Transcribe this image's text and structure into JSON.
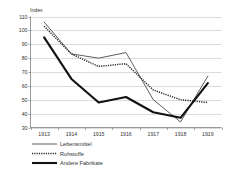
{
  "chart_data": {
    "type": "line",
    "title": "",
    "ylabel": "Index",
    "xlabel": "",
    "grid": true,
    "legend_position": "bottom-left",
    "ylim": [
      30,
      110
    ],
    "yticks": [
      30,
      40,
      50,
      60,
      70,
      80,
      90,
      100,
      110
    ],
    "categories": [
      "1913",
      "1914",
      "1915",
      "1916",
      "1917",
      "1918",
      "1919"
    ],
    "series": [
      {
        "name": "Lebensmittel",
        "style": "solid-thin",
        "color": "#4c4c4c",
        "values": [
          106,
          83,
          80,
          84,
          50,
          34,
          67
        ]
      },
      {
        "name": "Rohstoffe",
        "style": "dotted",
        "color": "#2b2b2b",
        "values": [
          103,
          83,
          74,
          76,
          57,
          50,
          48
        ]
      },
      {
        "name": "Andere Fabrikate",
        "style": "solid-thick",
        "color": "#111111",
        "values": [
          95,
          65,
          48,
          52,
          41,
          37,
          62
        ]
      }
    ]
  },
  "axis": {
    "y_title": "Index",
    "y_tick_labels": [
      "110",
      "100",
      "90",
      "80",
      "70",
      "60",
      "50",
      "40",
      "30"
    ],
    "x_tick_labels": [
      "1913",
      "1914",
      "1915",
      "1916",
      "1917",
      "1918",
      "1919"
    ]
  },
  "legend": {
    "items": [
      {
        "label": "Lebensmittel"
      },
      {
        "label": "Rohstoffe"
      },
      {
        "label": "Andere Fabrikate"
      }
    ]
  }
}
